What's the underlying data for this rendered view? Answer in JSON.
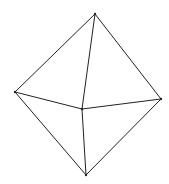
{
  "diagram": {
    "type": "octahedron-wireframe",
    "stroke_color": "#222222",
    "background": "#ffffff",
    "vertices": [
      {
        "id": "top",
        "x": 95,
        "y": 14
      },
      {
        "id": "left",
        "x": 15,
        "y": 92
      },
      {
        "id": "right",
        "x": 161,
        "y": 99
      },
      {
        "id": "center",
        "x": 82,
        "y": 109
      },
      {
        "id": "bottom",
        "x": 86,
        "y": 175
      }
    ],
    "edges": [
      [
        "top",
        "left"
      ],
      [
        "top",
        "right"
      ],
      [
        "top",
        "center"
      ],
      [
        "left",
        "center"
      ],
      [
        "center",
        "right"
      ],
      [
        "left",
        "bottom"
      ],
      [
        "right",
        "bottom"
      ],
      [
        "center",
        "bottom"
      ]
    ]
  }
}
